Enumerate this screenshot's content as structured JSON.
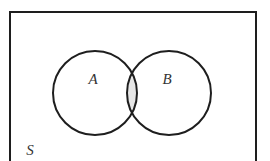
{
  "diagram": {
    "type": "venn",
    "universe": {
      "label": "S",
      "frame": {
        "x": 10,
        "y": 12,
        "width": 246,
        "height": 160
      },
      "bottom_edge_visible": false
    },
    "sets": [
      {
        "label": "A",
        "cx": 95,
        "cy": 93,
        "r": 42,
        "label_x": 93,
        "label_y": 84
      },
      {
        "label": "B",
        "cx": 169,
        "cy": 93,
        "r": 42,
        "label_x": 167,
        "label_y": 84
      }
    ],
    "shaded_region": "A ∩ B",
    "colors": {
      "stroke": "#1e1e1e",
      "shade": "#e6e6e6",
      "background": "#ffffff",
      "label": "#333333"
    },
    "universe_label_pos": {
      "x": 30,
      "y": 155
    }
  }
}
